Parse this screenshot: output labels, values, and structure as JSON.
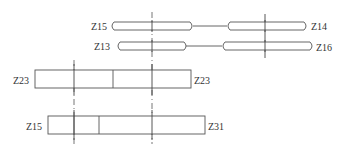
{
  "diagram": {
    "type": "gear-transmission-schematic",
    "labels": {
      "z15_top": "Z15",
      "z14": "Z14",
      "z13": "Z13",
      "z16": "Z16",
      "z23_left": "Z23",
      "z23_right": "Z23",
      "z15_bottom": "Z15",
      "z31": "Z31"
    },
    "gear_pairs": [
      {
        "row": 1,
        "left": "Z15",
        "right": "Z14"
      },
      {
        "row": 2,
        "left": "Z13",
        "right": "Z16"
      }
    ],
    "shafts": [
      {
        "name": "middle",
        "left_label": "Z23",
        "right_label": "Z23"
      },
      {
        "name": "bottom",
        "left_label": "Z15",
        "right_label": "Z31"
      }
    ],
    "colors": {
      "line": "#555555",
      "text": "#333333",
      "background": "#ffffff"
    }
  }
}
